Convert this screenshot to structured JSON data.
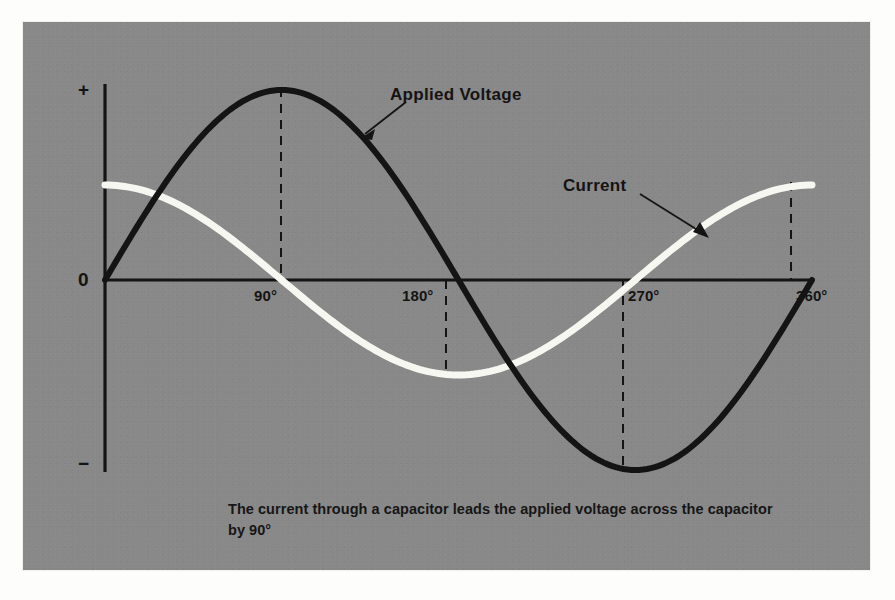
{
  "figure": {
    "panel_bg": "#8a8a8a",
    "ink": "#141414",
    "current_color": "#f7f7f2",
    "voltage_color": "#141414",
    "caption": "The current through a capacitor leads the applied voltage across the capacitor by 90°"
  },
  "axis": {
    "y_plus": "+",
    "y_zero": "0",
    "y_minus": "−"
  },
  "labels": {
    "voltage": "Applied Voltage",
    "current": "Current"
  },
  "chart_data": {
    "type": "line",
    "title": "",
    "subtitle": "",
    "xlabel": "",
    "ylabel": "",
    "xlim": [
      0,
      360
    ],
    "ylim": [
      -1,
      1
    ],
    "grid": false,
    "legend": "inline-annotations",
    "x_ticks": [
      "90°",
      "180°",
      "270°",
      "360°"
    ],
    "x_tick_values": [
      90,
      180,
      270,
      360
    ],
    "y_ticks": [
      "+",
      "0",
      "−"
    ],
    "y_tick_values": [
      1,
      0,
      -1
    ],
    "annotations": [
      {
        "text": "Applied Voltage",
        "points_to_series": "Applied Voltage",
        "x": 128,
        "y": 0.72
      },
      {
        "text": "Current",
        "points_to_series": "Current",
        "x": 300,
        "y": 0.4
      }
    ],
    "dashed_guides": [
      {
        "x": 90,
        "from_y": 0,
        "to_y": 1.0,
        "series": "Applied Voltage"
      },
      {
        "x": 180,
        "from_y": 0,
        "to_y": -0.5,
        "series": "Current"
      },
      {
        "x": 270,
        "from_y": 0,
        "to_y": -1.0,
        "series": "Applied Voltage"
      },
      {
        "x": 360,
        "from_y": 0,
        "to_y": 0.5,
        "series": "Current"
      }
    ],
    "x": [
      0,
      15,
      30,
      45,
      60,
      75,
      90,
      105,
      120,
      135,
      150,
      165,
      180,
      195,
      210,
      225,
      240,
      255,
      270,
      285,
      300,
      315,
      330,
      345,
      360
    ],
    "series": [
      {
        "name": "Applied Voltage",
        "color": "#141414",
        "amplitude": 1.0,
        "phase_deg": 0,
        "values": [
          0,
          0.259,
          0.5,
          0.707,
          0.866,
          0.966,
          1.0,
          0.966,
          0.866,
          0.707,
          0.5,
          0.259,
          0,
          -0.259,
          -0.5,
          -0.707,
          -0.866,
          -0.966,
          -1.0,
          -0.966,
          -0.866,
          -0.707,
          -0.5,
          -0.259,
          0
        ]
      },
      {
        "name": "Current",
        "color": "#f7f7f2",
        "amplitude": 0.5,
        "phase_deg": 90,
        "values": [
          0.5,
          0.483,
          0.433,
          0.354,
          0.25,
          0.129,
          0,
          -0.129,
          -0.25,
          -0.354,
          -0.433,
          -0.483,
          -0.5,
          -0.483,
          -0.433,
          -0.354,
          -0.25,
          -0.129,
          0,
          0.129,
          0.25,
          0.354,
          0.433,
          0.483,
          0.5
        ]
      }
    ]
  }
}
